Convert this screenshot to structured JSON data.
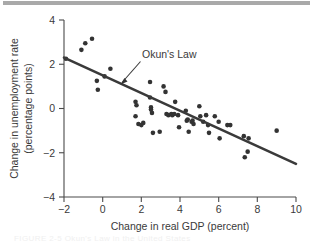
{
  "figure": {
    "top_rule_color": "#a9a9a9",
    "background": "#ffffff",
    "faint_caption": "FIGURE 2-5  Okun's Law in the United States"
  },
  "chart_data": {
    "type": "scatter",
    "title": "",
    "subtitle": "",
    "xlabel": "Change in real GDP (percent)",
    "ylabel": "Change in unemployment rate (percentage points)",
    "ylabel_line1": "Change in unemployment rate",
    "ylabel_line2": "(percentage points)",
    "xlim": [
      -2,
      10
    ],
    "ylim": [
      -4,
      4
    ],
    "xticks": [
      -2,
      0,
      2,
      4,
      6,
      8,
      10
    ],
    "xtick_labels": [
      "−2",
      "0",
      "2",
      "4",
      "6",
      "8",
      "10"
    ],
    "yticks": [
      -4,
      -2,
      0,
      2,
      4
    ],
    "ytick_labels": [
      "−4",
      "−2",
      "0",
      "2",
      "4"
    ],
    "grid": false,
    "legend": null,
    "marker_color": "#333333",
    "marker_size": 2.3,
    "annotations": [
      {
        "text": "Okun's Law",
        "text_x": 2.0,
        "text_y": 2.05,
        "arrow_from_x": 1.95,
        "arrow_from_y": 1.75,
        "arrow_to_x": 1.0,
        "arrow_to_y": 0.85
      }
    ],
    "series": [
      {
        "name": "Annual observations",
        "type": "scatter",
        "points": [
          [
            -1.9,
            2.25
          ],
          [
            -1.1,
            2.65
          ],
          [
            -0.9,
            2.95
          ],
          [
            -0.55,
            3.15
          ],
          [
            -0.3,
            1.25
          ],
          [
            -0.25,
            0.85
          ],
          [
            0.1,
            1.45
          ],
          [
            0.4,
            1.8
          ],
          [
            1.7,
            0.3
          ],
          [
            1.75,
            0.15
          ],
          [
            1.7,
            -0.35
          ],
          [
            1.85,
            -0.7
          ],
          [
            2.0,
            -0.75
          ],
          [
            2.1,
            -0.65
          ],
          [
            2.45,
            1.2
          ],
          [
            2.45,
            0.5
          ],
          [
            2.5,
            0.05
          ],
          [
            2.5,
            -0.05
          ],
          [
            2.55,
            -0.2
          ],
          [
            2.6,
            -1.1
          ],
          [
            2.95,
            -1.05
          ],
          [
            3.15,
            1.0
          ],
          [
            3.25,
            0.75
          ],
          [
            3.3,
            -0.25
          ],
          [
            3.4,
            -0.3
          ],
          [
            3.55,
            -0.25
          ],
          [
            3.6,
            -0.3
          ],
          [
            3.7,
            -0.25
          ],
          [
            3.75,
            0.3
          ],
          [
            3.9,
            -0.3
          ],
          [
            3.95,
            -0.85
          ],
          [
            4.3,
            -0.1
          ],
          [
            4.35,
            -0.55
          ],
          [
            4.4,
            -0.5
          ],
          [
            4.45,
            -1.05
          ],
          [
            4.6,
            -0.6
          ],
          [
            4.65,
            -0.55
          ],
          [
            4.7,
            -0.7
          ],
          [
            5.0,
            0.1
          ],
          [
            5.05,
            -0.35
          ],
          [
            5.2,
            -0.6
          ],
          [
            5.35,
            -0.3
          ],
          [
            5.45,
            -0.75
          ],
          [
            5.5,
            -1.1
          ],
          [
            5.8,
            -0.35
          ],
          [
            6.0,
            -0.6
          ],
          [
            6.05,
            -1.35
          ],
          [
            6.45,
            -0.75
          ],
          [
            6.6,
            -0.75
          ],
          [
            7.3,
            -1.25
          ],
          [
            7.35,
            -2.2
          ],
          [
            7.5,
            -1.95
          ],
          [
            7.55,
            -1.35
          ],
          [
            9.0,
            -1.0
          ]
        ]
      },
      {
        "name": "Okun's Law fit line",
        "type": "line",
        "points": [
          [
            -2.0,
            2.3
          ],
          [
            10.0,
            -2.5
          ]
        ]
      }
    ]
  }
}
